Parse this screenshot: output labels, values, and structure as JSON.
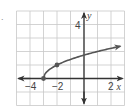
{
  "marker": ".",
  "chart_data": {
    "type": "line",
    "title": "",
    "function": "y = sqrt(x + 3)",
    "xlabel": "x",
    "ylabel": "y",
    "xlim": [
      -5,
      3
    ],
    "ylim": [
      -2,
      5
    ],
    "grid": true,
    "x_tick_labels": [
      {
        "value": -4,
        "label": "−4"
      },
      {
        "value": -2,
        "label": "−2"
      },
      {
        "value": 2,
        "label": "2"
      }
    ],
    "y_tick_labels": [
      {
        "value": 4,
        "label": "4"
      }
    ],
    "series": [
      {
        "name": "curve",
        "x": [
          -3,
          -2.75,
          -2.5,
          -2,
          -1,
          0,
          1,
          2,
          3
        ],
        "y": [
          0,
          0.5,
          0.71,
          1,
          1.41,
          1.73,
          2,
          2.24,
          2.45
        ],
        "start_point": [
          -3,
          0
        ],
        "marked_points": [
          [
            -3,
            0
          ],
          [
            -2,
            1
          ]
        ],
        "arrow_end": true
      }
    ],
    "colors": {
      "curve": "#555555",
      "axes": "#333333",
      "grid": "#c8c8c8"
    }
  }
}
